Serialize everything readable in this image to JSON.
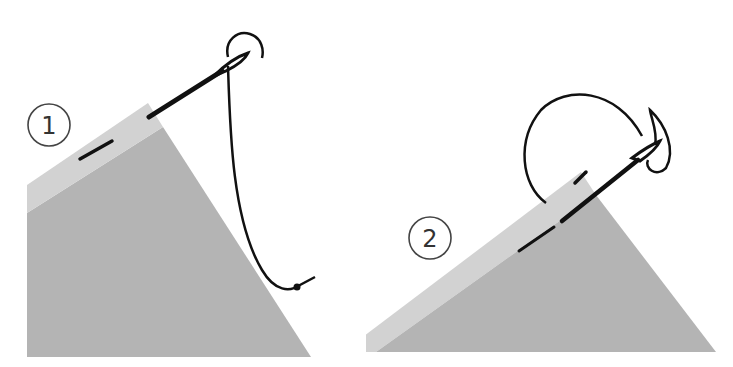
{
  "figure": {
    "colors": {
      "background": "#ffffff",
      "fabric_body": "#b4b4b4",
      "fabric_fold": "#d2d2d2",
      "thread": "#111111",
      "label_stroke": "#444444"
    },
    "steps": [
      {
        "number": "1",
        "caption": ""
      },
      {
        "number": "2",
        "caption": ""
      }
    ]
  }
}
